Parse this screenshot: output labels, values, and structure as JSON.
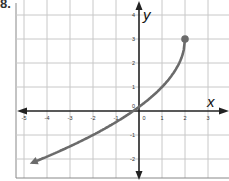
{
  "problem_label": "8.",
  "chart_data": {
    "type": "line",
    "title": "",
    "xlabel": "x",
    "ylabel": "y",
    "xlim": [
      -5.5,
      3.8
    ],
    "ylim": [
      -2.8,
      4.5
    ],
    "x_ticks": [
      -5,
      -4,
      -3,
      -2,
      -1,
      0,
      1,
      2,
      3
    ],
    "y_ticks": [
      -2,
      -1,
      0,
      1,
      2,
      3,
      4
    ],
    "x_tick_labels": [
      "-5",
      "-4",
      "-3",
      "-2",
      "-1",
      "0",
      "1",
      "2",
      "3"
    ],
    "y_tick_labels": [
      "-2",
      "-1",
      "0",
      "1",
      "2",
      "3",
      "4"
    ],
    "grid": true,
    "series": [
      {
        "name": "curve",
        "description": "Curve starting at closed endpoint (2, 3), decreasing to the left through about (-0.25, 0), ending with an arrow toward the lower left near (-4.6, -2.1)",
        "function_estimate": "y = 3 - 2*sqrt(2 - x)",
        "endpoint": {
          "x": 2,
          "y": 3,
          "closed": true
        },
        "points": [
          {
            "x": 2,
            "y": 3
          },
          {
            "x": 1.9,
            "y": 2.37
          },
          {
            "x": 1.75,
            "y": 2.0
          },
          {
            "x": 1.5,
            "y": 1.59
          },
          {
            "x": 1,
            "y": 1.0
          },
          {
            "x": 0.5,
            "y": 0.55
          },
          {
            "x": 0,
            "y": 0.17
          },
          {
            "x": -0.25,
            "y": 0.0
          },
          {
            "x": -1,
            "y": -0.46
          },
          {
            "x": -2,
            "y": -1.0
          },
          {
            "x": -3,
            "y": -1.47
          },
          {
            "x": -4,
            "y": -1.9
          },
          {
            "x": -4.6,
            "y": -2.14
          }
        ],
        "arrow_end": "lower-left",
        "color": "#6b6b6b"
      }
    ],
    "colors": {
      "grid": "#c8c8c8",
      "axis": "#222222",
      "curve": "#6b6b6b"
    }
  }
}
